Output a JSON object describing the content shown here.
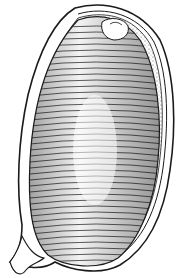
{
  "image": {
    "subject": "engraved botanical illustration of a seed/fruit in longitudinal section",
    "style": "black ink line engraving on white",
    "colors": {
      "ink": "#1a1a1a",
      "paper": "#ffffff",
      "stipple": "#555555"
    }
  }
}
